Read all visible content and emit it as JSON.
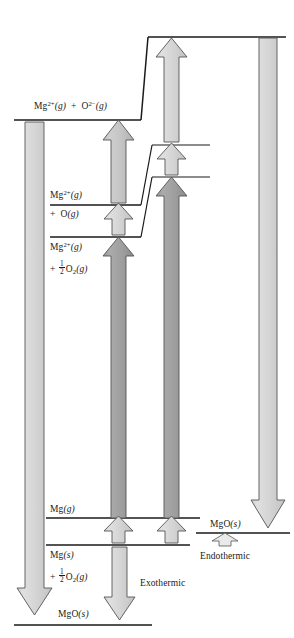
{
  "diagram": {
    "colors": {
      "line": "#1a1a1a",
      "arrow_light": "#d2d2d2",
      "arrow_medium": "#bdbdbd",
      "arrow_dark": "#9a9a9a",
      "arrow_outline": "#555555",
      "background": "#ffffff"
    },
    "levels": [
      {
        "id": "mg2-o2-gas",
        "label_parts": [
          "Mg",
          "2+",
          "(g)",
          " + ",
          "O",
          "2−",
          "(g)"
        ],
        "label_text": "Mg2+(g) + O2−(g)"
      },
      {
        "id": "mg2-plus-o-gas-line1",
        "label_text": "Mg2+(g)"
      },
      {
        "id": "mg2-plus-o-gas-line2",
        "label_text": "+ O(g)"
      },
      {
        "id": "mg2-half-o2-line1",
        "label_text": "Mg2+(g)"
      },
      {
        "id": "mg2-half-o2-line2",
        "label_text": "+ 1/2 O2(g)"
      },
      {
        "id": "mg-gas",
        "label_text": "Mg(g)"
      },
      {
        "id": "mg-solid-line1",
        "label_text": "Mg(s)"
      },
      {
        "id": "mg-solid-line2",
        "label_text": "+ 1/2 O2(g)"
      },
      {
        "id": "mgo-solid-right",
        "label_text": "MgO(s)"
      },
      {
        "id": "mgo-solid-bottom",
        "label_text": "MgO(s)"
      }
    ],
    "annotations": {
      "endothermic": "Endothermic",
      "exothermic": "Exothermic"
    }
  }
}
